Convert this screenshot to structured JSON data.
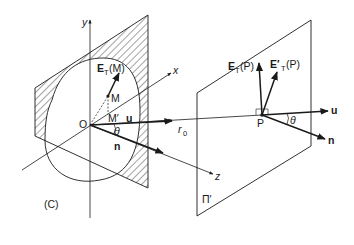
{
  "diagram": {
    "colors": {
      "line": "#1a1a1a",
      "background": "#ffffff",
      "hatch": "#333333"
    },
    "source_plane": {
      "aperture_label": "(C)",
      "origin_label": "O",
      "axes": {
        "x": "x",
        "y": "y",
        "z": "z"
      },
      "point_M": "M",
      "point_M_prime": "M′",
      "field_M_main": "E",
      "field_M_sub": "T",
      "field_M_arg": "(M)",
      "vector_u": "u",
      "vector_n": "n",
      "angle": "θ"
    },
    "propagation": {
      "distance_label": "r",
      "distance_sub": "0"
    },
    "observation_plane": {
      "plane_label": "Π′",
      "point_P": "P",
      "field_P_main": "E",
      "field_P_sub": "T",
      "field_P_arg": "(P)",
      "field_P_prime_main": "E′",
      "field_P_prime_sub": "T",
      "field_P_prime_arg": "(P)",
      "vector_u": "u",
      "vector_n": "n",
      "angle": "θ"
    }
  }
}
